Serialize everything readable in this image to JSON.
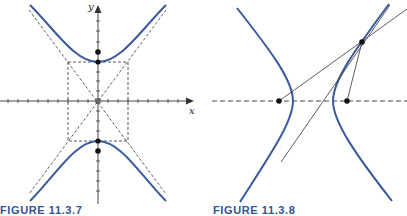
{
  "figures": [
    {
      "caption": "FIGURE 11.3.7",
      "x_label": "x",
      "y_label": "y",
      "description": "Vertical hyperbola centered at origin with dashed central rectangle, dashed asymptotes, vertices and foci on y-axis"
    },
    {
      "caption": "FIGURE 11.3.8",
      "description": "Horizontal hyperbola with two foci on dashed axis, point P on right branch, focal lines and tangent line through P"
    }
  ],
  "colors": {
    "curve": "#3a5a9c",
    "caption": "#2f5596",
    "lines": "#333333"
  }
}
